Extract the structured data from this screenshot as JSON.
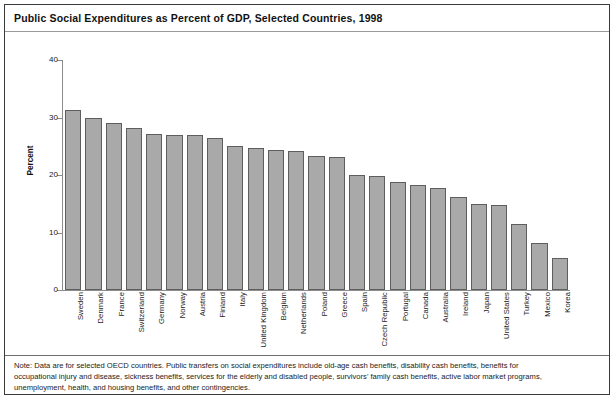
{
  "figure": {
    "title": "Public Social Expenditures as Percent of GDP, Selected Countries, 1998",
    "note_lines": [
      "Note: Data are for selected OECD countries. Public transfers on social expenditures include old-age cash benefits, disability cash benefits, benefits for",
      "occupational injury and disease, sickness benefits, services for the elderly and disabled people, survivors' family cash benefits, active labor market programs,",
      "unemployment, health, and housing benefits, and other contingencies."
    ]
  },
  "colors": {
    "bar_fill": "#a9a9a9",
    "bar_border": "#5e5e5e",
    "axis": "#8c8c8c",
    "frame": "#3a3a3a",
    "text": "#1b1b1b"
  },
  "chart_data": {
    "type": "bar",
    "title": "Public Social Expenditures as Percent of GDP, Selected Countries, 1998",
    "xlabel": "",
    "ylabel": "Percent",
    "ylim": [
      0,
      40
    ],
    "yticks": [
      0,
      10,
      20,
      30,
      40
    ],
    "ytick_labels": [
      "0",
      "10",
      "20",
      "30",
      "40"
    ],
    "grid": false,
    "legend": "none",
    "categories": [
      "Sweden",
      "Denmark",
      "France",
      "Switzerland",
      "Germany",
      "Norway",
      "Austria",
      "Finland",
      "Italy",
      "United Kingdom",
      "Belgium",
      "Netherlands",
      "Poland",
      "Greece",
      "Spain",
      "Czech Republic",
      "Portugal",
      "Canada",
      "Australia",
      "Ireland",
      "Japan",
      "United States",
      "Turkey",
      "Mexico",
      "Korea"
    ],
    "values": [
      31.3,
      30.0,
      29.0,
      28.2,
      27.1,
      27.0,
      27.0,
      26.5,
      25.1,
      24.7,
      24.4,
      24.2,
      23.3,
      23.2,
      20.0,
      19.9,
      18.7,
      18.3,
      17.8,
      16.1,
      14.9,
      14.8,
      11.5,
      8.2,
      5.5
    ]
  }
}
